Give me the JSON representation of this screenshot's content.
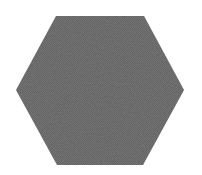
{
  "canvas": {
    "width": 202,
    "height": 175,
    "background": "#ffffff"
  },
  "shape": {
    "type": "hexagon",
    "orientation": "flat-top",
    "fill": "#7a7a7a",
    "texture": "dithered-noise",
    "points": "56,16 144,16 184,90 143,165 57,165 16,90"
  }
}
